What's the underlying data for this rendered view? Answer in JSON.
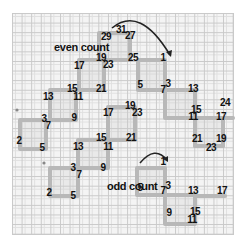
{
  "diagram": {
    "captions": {
      "even": "even count",
      "odd": "odd count"
    },
    "even_path_labels": [
      "29",
      "31",
      "27",
      "19",
      "23",
      "25",
      "1",
      "17",
      "21",
      "15",
      "11",
      "13",
      "3",
      "7",
      "9",
      "2",
      "5",
      "5",
      "7",
      "3",
      "13",
      "15",
      "11",
      "17",
      "21",
      "19",
      "23",
      "24"
    ],
    "odd_path_labels": [
      "17",
      "19",
      "23",
      "21",
      "1",
      "15",
      "11",
      "13",
      "3",
      "7",
      "9",
      "2",
      "5",
      "5",
      "7",
      "3",
      "13",
      "17",
      "9",
      "15",
      "11"
    ],
    "colors": {
      "grid_line": "#c9c9c9",
      "stitch": "#b8b8b8",
      "arrow": "#222222",
      "text": "#111111"
    }
  }
}
